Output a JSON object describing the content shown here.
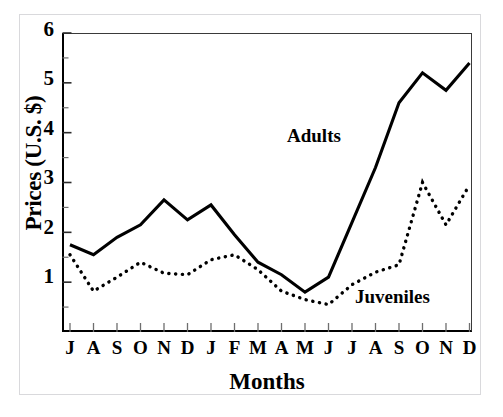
{
  "chart_data": {
    "type": "line",
    "title": "",
    "xlabel": "Months",
    "ylabel": "Prices (U.S. $)",
    "ylim": [
      1,
      7
    ],
    "yticks": [
      1,
      2,
      3,
      4,
      5,
      6,
      7
    ],
    "ytick_labels": [
      "1",
      "2",
      "3",
      "4",
      "5",
      "6",
      "7"
    ],
    "minor_yticks": [
      1.5,
      2.5,
      3.5,
      4.5,
      5.5,
      6.5
    ],
    "grid": false,
    "legend_position": "inline-annotations",
    "categories": [
      "J",
      "A",
      "S",
      "O",
      "N",
      "D",
      "J",
      "F",
      "M",
      "A",
      "M",
      "J",
      "J",
      "A",
      "S",
      "O",
      "N",
      "D"
    ],
    "series": [
      {
        "name": "Adults",
        "line_style": "solid",
        "color": "#000000",
        "values": [
          2.75,
          2.55,
          2.9,
          3.15,
          3.65,
          3.25,
          3.55,
          2.95,
          2.4,
          2.15,
          1.8,
          2.1,
          3.2,
          4.3,
          5.6,
          6.2,
          5.85,
          6.4
        ]
      },
      {
        "name": "Juveniles",
        "line_style": "dotted",
        "color": "#000000",
        "values": [
          2.55,
          1.82,
          2.1,
          2.4,
          2.18,
          2.15,
          2.45,
          2.55,
          2.25,
          1.82,
          1.65,
          1.55,
          1.95,
          2.2,
          2.35,
          4.0,
          3.15,
          3.95
        ]
      }
    ],
    "annotations": [
      {
        "text": "Adults",
        "series": "Adults"
      },
      {
        "text": "Juveniles",
        "series": "Juveniles"
      }
    ]
  },
  "axes": {
    "y_label_text": "Prices (U.S. $)",
    "x_label_text": "Months"
  },
  "labels": {
    "adults": "Adults",
    "juveniles": "Juveniles"
  }
}
